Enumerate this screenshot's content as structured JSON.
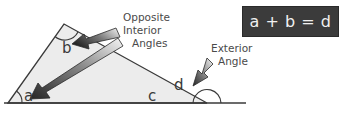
{
  "diagram": {
    "angles": {
      "a": "a",
      "b": "b",
      "c": "c",
      "d": "d"
    },
    "callouts": {
      "interior": {
        "line1": "Opposite",
        "line2": "Interior",
        "line3": "Angles"
      },
      "exterior": {
        "line1": "Exterior",
        "line2": "Angle"
      }
    },
    "equation": "a + b = d",
    "colors": {
      "triangle_fill": "#ececec",
      "line": "#3a3a3a",
      "equation_bg": "#3b3b3b",
      "equation_text": "#f0f0f0",
      "arrow_dark": "#2e2e2e",
      "arrow_light": "#f4f4f4"
    }
  }
}
